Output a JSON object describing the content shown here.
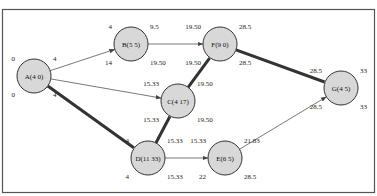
{
  "diagram": {
    "type": "network",
    "colors": {
      "node_fill": "#d8d8d8",
      "node_stroke": "#333333",
      "edge": "#555555",
      "critical_edge": "#333333",
      "frame": "#555555"
    },
    "nodes": [
      {
        "id": "A",
        "label": "A(4 0)",
        "x": 34,
        "y": 76,
        "ES": "0",
        "EF": "4",
        "LS": "0",
        "LF": "4"
      },
      {
        "id": "B",
        "label": "B(5 5)",
        "x": 131,
        "y": 44,
        "ES": "4",
        "EF": "9.5",
        "LS": "14",
        "LF": "19.50"
      },
      {
        "id": "C",
        "label": "C(4 17)",
        "x": 178,
        "y": 101,
        "ES": "15.33",
        "EF": "19.50",
        "LS": "15.33",
        "LF": "19.50"
      },
      {
        "id": "D",
        "label": "D(11 33)",
        "x": 148,
        "y": 158,
        "ES": "4",
        "EF": "15.33",
        "LS": "4",
        "LF": "15.33"
      },
      {
        "id": "E",
        "label": "E(6 5)",
        "x": 225,
        "y": 158,
        "ES": "15.33",
        "EF": "21.83",
        "LS": "22",
        "LF": "28.5"
      },
      {
        "id": "F",
        "label": "F(9 0)",
        "x": 220,
        "y": 44,
        "ES": "19.50",
        "EF": "28.5",
        "LS": "19.50",
        "LF": "28.5"
      },
      {
        "id": "G",
        "label": "G(4 5)",
        "x": 341,
        "y": 88,
        "ES": "28.5",
        "EF": "33",
        "LS": "28.5",
        "LF": "33"
      }
    ],
    "edges": [
      {
        "from": "A",
        "to": "B",
        "critical": false
      },
      {
        "from": "A",
        "to": "C",
        "critical": false
      },
      {
        "from": "A",
        "to": "D",
        "critical": true
      },
      {
        "from": "B",
        "to": "F",
        "critical": false
      },
      {
        "from": "D",
        "to": "C",
        "critical": true
      },
      {
        "from": "C",
        "to": "F",
        "critical": true
      },
      {
        "from": "D",
        "to": "E",
        "critical": false
      },
      {
        "from": "F",
        "to": "G",
        "critical": true
      },
      {
        "from": "E",
        "to": "G",
        "critical": false
      }
    ]
  }
}
